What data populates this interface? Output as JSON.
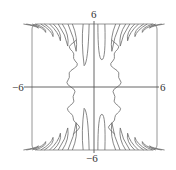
{
  "chart_data": {
    "type": "line",
    "title": "",
    "subtitle": "",
    "xlabel": "",
    "ylabel": "",
    "xlim": [
      -6,
      6
    ],
    "ylim": [
      -6,
      6
    ],
    "grid": false,
    "legend": null,
    "axis_labels": {
      "top": "6",
      "bottom": "−6",
      "left": "−6",
      "right": "6"
    },
    "frame": {
      "x0": 32,
      "y0": 24,
      "x1": 157,
      "y1": 150,
      "corner_radius": 5
    },
    "origin_px": {
      "x": 94,
      "y": 87
    },
    "colors": {
      "curve": "#6a6a6a",
      "axis": "#555555",
      "frame": "#8a8a8a"
    },
    "series": [
      {
        "name": "top-lobes-left",
        "lobe_tips_x": [
          -1.7,
          -2.5,
          -3.2,
          -3.9,
          -4.6,
          -5.3
        ],
        "lobe_tips_y": [
          3.4,
          3.9,
          4.4,
          4.8,
          5.2,
          5.6
        ]
      },
      {
        "name": "top-lobes-right",
        "lobe_tips_x": [
          1.7,
          2.5,
          3.2,
          3.9,
          4.6,
          5.3
        ],
        "lobe_tips_y": [
          3.4,
          3.9,
          4.4,
          4.8,
          5.2,
          5.6
        ]
      },
      {
        "name": "bottom-lobes-left",
        "lobe_tips_x": [
          -1.7,
          -2.5,
          -3.2,
          -3.9,
          -4.6,
          -5.3
        ],
        "lobe_tips_y": [
          -3.4,
          -3.9,
          -4.4,
          -4.8,
          -5.2,
          -5.6
        ]
      },
      {
        "name": "bottom-lobes-right",
        "lobe_tips_x": [
          1.7,
          2.5,
          3.2,
          3.9,
          4.6,
          5.3
        ],
        "lobe_tips_y": [
          -3.4,
          -3.9,
          -4.4,
          -4.8,
          -5.2,
          -5.6
        ]
      },
      {
        "name": "center-left-wavy",
        "x_approx": -2.0,
        "y_range": [
          -4.5,
          4.5
        ]
      },
      {
        "name": "center-right-wavy",
        "x_approx": 2.0,
        "y_range": [
          -4.5,
          4.5
        ]
      },
      {
        "name": "center-top-lobe",
        "x_approx": 0.6,
        "tip_y": 2.6
      },
      {
        "name": "center-bottom-lobe",
        "x_approx": 0.6,
        "tip_y": -2.6
      }
    ]
  }
}
